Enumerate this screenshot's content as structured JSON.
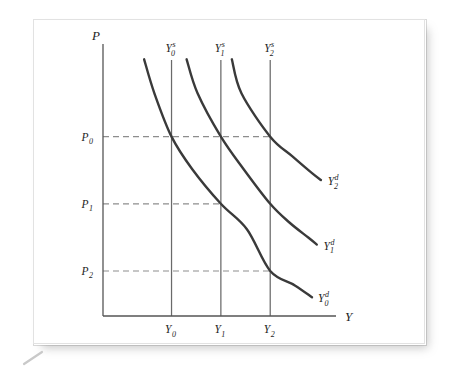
{
  "figure": {
    "background_color": "#ffffff",
    "plate_color": "#ffffff",
    "ink_color": "#3a3a3a",
    "axis_color": "#555555",
    "dash_color": "#8d8d8d"
  },
  "axes": {
    "y_axis_title": "P",
    "x_axis_title": "Y"
  },
  "chart_data": {
    "type": "line",
    "title": "",
    "subtitle": "",
    "xlabel": "Y",
    "ylabel": "P",
    "grid": false,
    "legend_position": "inline-end-of-curve",
    "xlim": [
      0,
      3.4
    ],
    "ylim": [
      0,
      3.2
    ],
    "x_ticks": [
      {
        "id": "Y0",
        "base": "Y",
        "sub": "0",
        "value": 1.0
      },
      {
        "id": "Y1",
        "base": "Y",
        "sub": "1",
        "value": 1.72
      },
      {
        "id": "Y2",
        "base": "Y",
        "sub": "2",
        "value": 2.44
      }
    ],
    "y_ticks": [
      {
        "id": "P0",
        "base": "P",
        "sub": "0",
        "value": 2.11
      },
      {
        "id": "P1",
        "base": "P",
        "sub": "1",
        "value": 1.32
      },
      {
        "id": "P2",
        "base": "P",
        "sub": "2",
        "value": 0.53
      }
    ],
    "series": [
      {
        "name": "Y0s",
        "base": "Y",
        "sup": "s",
        "sub": "0",
        "kind": "supply",
        "orientation": "vertical",
        "x": 1.0,
        "label_above": true
      },
      {
        "name": "Y1s",
        "base": "Y",
        "sup": "s",
        "sub": "1",
        "kind": "supply",
        "orientation": "vertical",
        "x": 1.72,
        "label_above": true
      },
      {
        "name": "Y2s",
        "base": "Y",
        "sup": "s",
        "sub": "2",
        "kind": "supply",
        "orientation": "vertical",
        "x": 2.44,
        "label_above": true
      },
      {
        "name": "Y0d",
        "base": "Y",
        "sup": "d",
        "sub": "0",
        "kind": "demand",
        "shape": "downward-sloping-convex",
        "points": [
          [
            0.6,
            3.02
          ],
          [
            0.75,
            2.62
          ],
          [
            1.0,
            2.11
          ],
          [
            1.3,
            1.73
          ],
          [
            1.72,
            1.32
          ],
          [
            2.1,
            1.02
          ],
          [
            2.44,
            0.53
          ],
          [
            2.8,
            0.36
          ],
          [
            3.05,
            0.22
          ]
        ],
        "label_at": [
          3.08,
          0.22
        ]
      },
      {
        "name": "Y1d",
        "base": "Y",
        "sup": "d",
        "sub": "1",
        "kind": "demand",
        "shape": "downward-sloping-convex",
        "points": [
          [
            1.22,
            3.02
          ],
          [
            1.38,
            2.62
          ],
          [
            1.72,
            2.11
          ],
          [
            2.05,
            1.73
          ],
          [
            2.44,
            1.32
          ],
          [
            2.72,
            1.1
          ],
          [
            3.0,
            0.92
          ],
          [
            3.12,
            0.84
          ]
        ],
        "label_at": [
          3.16,
          0.84
        ]
      },
      {
        "name": "Y2d",
        "base": "Y",
        "sup": "d",
        "sub": "2",
        "kind": "demand",
        "shape": "downward-sloping-convex",
        "points": [
          [
            1.88,
            3.02
          ],
          [
            2.02,
            2.62
          ],
          [
            2.44,
            2.11
          ],
          [
            2.76,
            1.88
          ],
          [
            3.05,
            1.68
          ],
          [
            3.18,
            1.6
          ]
        ],
        "label_at": [
          3.22,
          1.6
        ]
      }
    ],
    "equilibria": [
      {
        "label": "E0",
        "x": 1.0,
        "y": 2.11,
        "curves": [
          "Y0s",
          "Y0d"
        ]
      },
      {
        "label": "E1",
        "x": 1.72,
        "y": 2.11,
        "curves": [
          "Y1s",
          "Y1d"
        ]
      },
      {
        "label": "E2",
        "x": 2.44,
        "y": 2.11,
        "curves": [
          "Y2s",
          "Y2d"
        ]
      },
      {
        "label": "A",
        "x": 1.72,
        "y": 1.32,
        "curves": [
          "Y1s",
          "Y0d"
        ]
      },
      {
        "label": "B",
        "x": 2.44,
        "y": 0.53,
        "curves": [
          "Y2s",
          "Y0d"
        ]
      }
    ],
    "guide_lines": [
      {
        "from_axis": "P0",
        "y": 2.11,
        "x_end": 2.44,
        "style": "dashed"
      },
      {
        "from_axis": "P1",
        "y": 1.32,
        "x_end": 1.72,
        "style": "dashed"
      },
      {
        "from_axis": "P2",
        "y": 0.53,
        "x_end": 2.44,
        "style": "dashed"
      }
    ],
    "annotations": []
  }
}
